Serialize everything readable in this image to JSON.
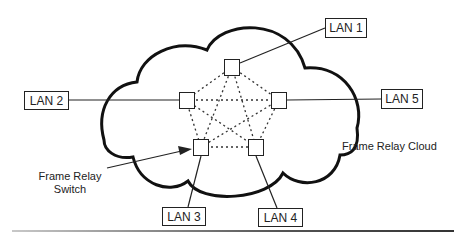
{
  "diagram": {
    "cloud_label": "Frame Relay Cloud",
    "switch_label_line1": "Frame Relay",
    "switch_label_line2": "Switch",
    "lans": [
      {
        "id": "lan1",
        "label": "LAN 1"
      },
      {
        "id": "lan2",
        "label": "LAN 2"
      },
      {
        "id": "lan3",
        "label": "LAN 3"
      },
      {
        "id": "lan4",
        "label": "LAN 4"
      },
      {
        "id": "lan5",
        "label": "LAN 5"
      }
    ],
    "switches": [
      {
        "id": "sw-top",
        "connects": "LAN 1"
      },
      {
        "id": "sw-left",
        "connects": "LAN 2"
      },
      {
        "id": "sw-bottom-left",
        "connects": "LAN 3"
      },
      {
        "id": "sw-bottom-right",
        "connects": "LAN 4"
      },
      {
        "id": "sw-right",
        "connects": "LAN 5"
      }
    ],
    "mesh": "full mesh of dashed virtual circuits between all 5 switches",
    "colors": {
      "stroke": "#222222",
      "background": "#ffffff"
    }
  }
}
